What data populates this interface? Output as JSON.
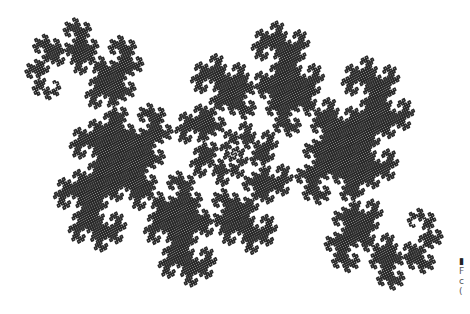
{
  "figure": {
    "ink_color": "#2a2a2a",
    "paper_color": "#ffffff",
    "bounds": {
      "x": 25,
      "y": 18,
      "width": 418,
      "height": 272
    },
    "lobes": [
      {
        "cx": 95,
        "cy": 115,
        "r": 60
      },
      {
        "cx": 150,
        "cy": 60,
        "r": 45
      },
      {
        "cx": 205,
        "cy": 60,
        "r": 40
      },
      {
        "cx": 240,
        "cy": 95,
        "r": 35
      },
      {
        "cx": 225,
        "cy": 165,
        "r": 45
      },
      {
        "cx": 265,
        "cy": 215,
        "r": 55
      },
      {
        "cx": 320,
        "cy": 255,
        "r": 35
      },
      {
        "cx": 360,
        "cy": 185,
        "r": 50
      },
      {
        "cx": 410,
        "cy": 180,
        "r": 35
      },
      {
        "cx": 190,
        "cy": 220,
        "r": 35
      }
    ]
  },
  "caption_fragment": {
    "lines": [
      "▮",
      "F",
      "c",
      "("
    ]
  }
}
